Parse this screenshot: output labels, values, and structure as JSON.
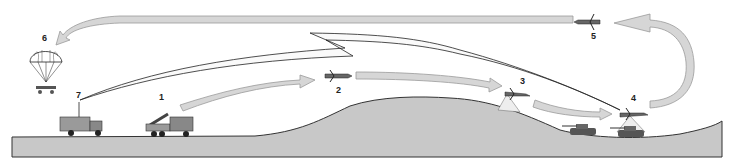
{
  "diagram": {
    "type": "mission-cycle-illustration",
    "colors": {
      "ground_fill": "#c8c8c8",
      "ground_stroke": "#333333",
      "arrow_fill": "#d6d6d6",
      "arrow_stroke": "#9a9a9a",
      "outline": "#222222",
      "background": "#ffffff"
    },
    "labels": [
      {
        "id": "1",
        "text": "1",
        "x": 160,
        "y": 96,
        "subject": "launcher-truck"
      },
      {
        "id": "2",
        "text": "2",
        "x": 337,
        "y": 83,
        "subject": "drone-in-flight"
      },
      {
        "id": "3",
        "text": "3",
        "x": 520,
        "y": 78,
        "subject": "drone-surveying-hill"
      },
      {
        "id": "4",
        "text": "4",
        "x": 630,
        "y": 96,
        "subject": "drone-over-tanks"
      },
      {
        "id": "5",
        "text": "5",
        "x": 591,
        "y": 32,
        "subject": "drone-returning"
      },
      {
        "id": "6",
        "text": "6",
        "x": 42,
        "y": 34,
        "subject": "parachute-recovery"
      },
      {
        "id": "7",
        "text": "7",
        "x": 76,
        "y": 92,
        "subject": "control-station-truck"
      }
    ]
  }
}
